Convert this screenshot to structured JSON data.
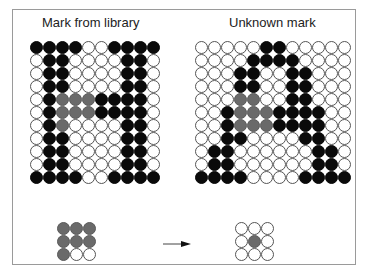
{
  "titles": {
    "left": "Mark from library",
    "right": "Unknown mark"
  },
  "colors": {
    "black": "#0a0a0a",
    "gray": "#6a6a6a",
    "white": "#ffffff",
    "frame": "#9a9a9a"
  },
  "library_mark": {
    "cols": 10,
    "rows": [
      "BBBBWWBBBB",
      "WBBWWWWBBW",
      "WBBWWWWBBW",
      "WBBWWWWBBW",
      "WBGGGBBBBW",
      "WBGGGBBBBW",
      "WBGWWWWBBW",
      "WBBWWWWBBW",
      "WBBWWWWBBW",
      "WBBWWWWBBW",
      "BBBBWWBBBB"
    ]
  },
  "unknown_mark": {
    "cols": 12,
    "rows": [
      "WWWWWBBWWWWW",
      "WWWWBBBBWWWW",
      "WWWBBWWBBWWW",
      "WWWBBWWBBWWW",
      "WWWGGWWBBWWW",
      "WWBGGGBBBBWW",
      "WWBGGGBBBBWW",
      "WWBBWWWWBBWW",
      "WBBWWWWWWBBW",
      "WBBWWWWWWBBW",
      "BBBBWWWWBBBB"
    ]
  },
  "library_window": {
    "cols": 3,
    "rows": [
      "GGG",
      "GGG",
      "GWW"
    ]
  },
  "unknown_window": {
    "cols": 3,
    "rows": [
      "WWW",
      "WGW",
      "WWW"
    ]
  },
  "arrow": "right-arrow"
}
